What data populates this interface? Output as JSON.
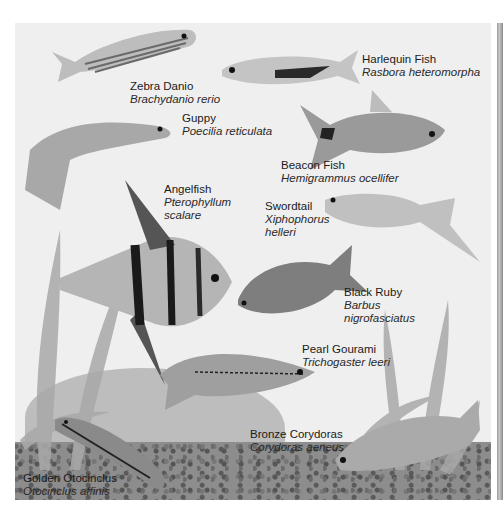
{
  "illustration": {
    "subject": "Freshwater aquarium fish",
    "colors": {
      "background": "#efefef",
      "page": "#ffffff",
      "text": "#1a1a1a",
      "gravel": "#8d8d8d"
    }
  },
  "labels": [
    {
      "id": "zebra-danio",
      "common": "Zebra Danio",
      "latin": [
        "Brachydanio rerio"
      ],
      "x": 130,
      "y": 80
    },
    {
      "id": "harlequin-fish",
      "common": "Harlequin Fish",
      "latin": [
        "Rasbora heteromorpha"
      ],
      "x": 362,
      "y": 53
    },
    {
      "id": "guppy",
      "common": "Guppy",
      "latin": [
        "Poecilia reticulata"
      ],
      "x": 182,
      "y": 112
    },
    {
      "id": "beacon-fish",
      "common": "Beacon Fish",
      "latin": [
        "Hemigrammus ocellifer"
      ],
      "x": 281,
      "y": 159
    },
    {
      "id": "angelfish",
      "common": "Angelfish",
      "latin": [
        "Pterophyllum",
        "scalare"
      ],
      "x": 164,
      "y": 183
    },
    {
      "id": "swordtail",
      "common": "Swordtail",
      "latin": [
        "Xiphophorus",
        "helleri"
      ],
      "x": 265,
      "y": 200
    },
    {
      "id": "black-ruby",
      "common": "Black Ruby",
      "latin": [
        "Barbus",
        "nigrofasciatus"
      ],
      "x": 344,
      "y": 286
    },
    {
      "id": "pearl-gourami",
      "common": "Pearl Gourami",
      "latin": [
        "Trichogaster leeri"
      ],
      "x": 302,
      "y": 343
    },
    {
      "id": "bronze-corydoras",
      "common": "Bronze Corydoras",
      "latin": [
        "Corydoras aeneus"
      ],
      "x": 250,
      "y": 428
    },
    {
      "id": "golden-otocinclus",
      "common": "Golden Otocinclus",
      "latin": [
        "Otocinclus affinis"
      ],
      "x": 23,
      "y": 472
    }
  ]
}
